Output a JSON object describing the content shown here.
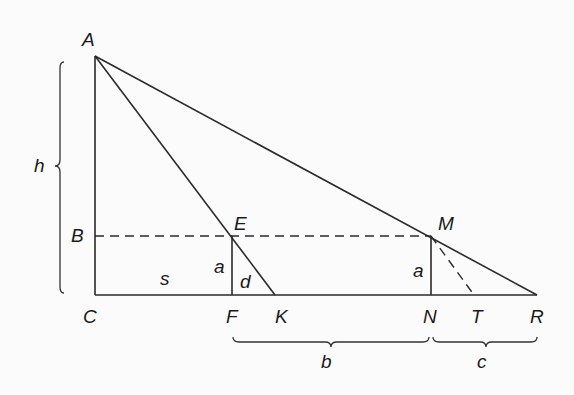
{
  "diagram": {
    "type": "geometry",
    "points": {
      "A": {
        "label": "A",
        "x": 95,
        "y": 56
      },
      "B": {
        "label": "B",
        "x": 95,
        "y": 236
      },
      "C": {
        "label": "C",
        "x": 95,
        "y": 295
      },
      "E": {
        "label": "E",
        "x": 232,
        "y": 236
      },
      "F": {
        "label": "F",
        "x": 232,
        "y": 295
      },
      "K": {
        "label": "K",
        "x": 275,
        "y": 295
      },
      "M": {
        "label": "M",
        "x": 431,
        "y": 236
      },
      "N": {
        "label": "N",
        "x": 431,
        "y": 295
      },
      "T": {
        "label": "T",
        "x": 474,
        "y": 295
      },
      "R": {
        "label": "R",
        "x": 537,
        "y": 295
      }
    },
    "segment_labels": {
      "s": "s",
      "a_left": "a",
      "d": "d",
      "a_right": "a",
      "h": "h",
      "b": "b",
      "c": "c"
    },
    "colors": {
      "line": "#2a2a2a",
      "background": "#fbfbfb"
    }
  }
}
